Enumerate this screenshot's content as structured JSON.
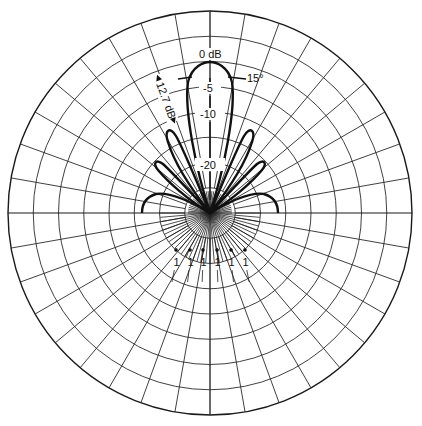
{
  "chart_data": {
    "type": "polar",
    "title": "",
    "center_px": [
      210,
      213
    ],
    "outer_radius_px": 202,
    "rings": 8,
    "spoke_spacing_deg": 10,
    "dense_fan": {
      "spacing_deg": 5,
      "radius_px": 50,
      "half": "lower"
    },
    "db_scale": {
      "zero_db_radius_px": 150,
      "labels": [
        "0 dB",
        "-5",
        "-10",
        "-20"
      ],
      "label_radii_px": [
        150,
        125,
        99,
        48
      ]
    },
    "annotations": {
      "beamwidth": "15°",
      "sidelobe_level": "12.7 dB",
      "marker_labels": [
        "1",
        "1",
        "1",
        "1",
        "1",
        "1"
      ]
    },
    "series": [
      {
        "name": "main lobe",
        "peak_deg": 0,
        "peak_db": 0,
        "half_width_deg": 15
      },
      {
        "name": "first side lobe",
        "peak_deg": 26,
        "peak_db": -12.7
      },
      {
        "name": "second side lobe",
        "peak_deg": 45,
        "peak_db": -17
      },
      {
        "name": "third side lobe",
        "peak_deg": 75,
        "peak_db": -20
      }
    ]
  },
  "labels": {
    "zero_db": "0 dB",
    "minus5": "-5",
    "minus10": "-10",
    "minus20": "-20",
    "beamwidth": "15°",
    "sidelobe": "12.7 dB",
    "marker": "1"
  }
}
